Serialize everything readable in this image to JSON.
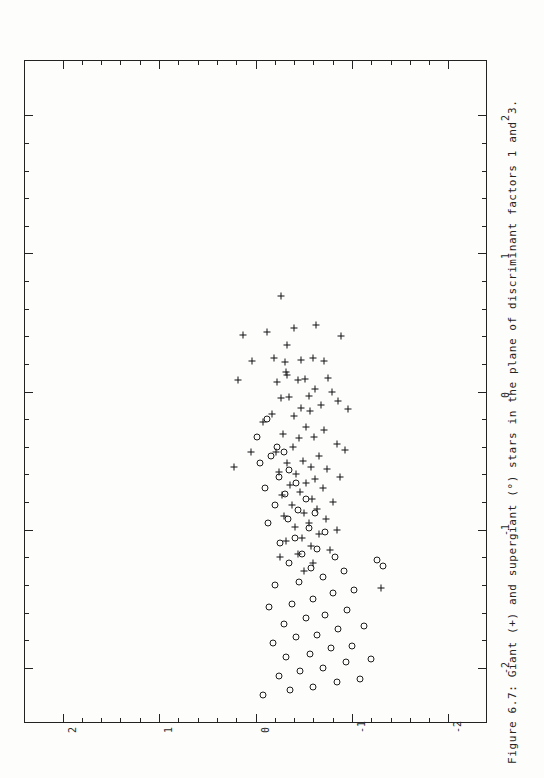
{
  "figure": {
    "caption": "Figure 6.7:  Giant  (+)  and supergiant  (°)  stars in the plane of discriminant factors 1 and 3.",
    "caption_label": "Figure 6.7:",
    "orientation": "rotated-90-ccw"
  },
  "chart_data": {
    "type": "scatter",
    "title": "Figure 6.7:  Giant  (+)  and supergiant  (°)  stars in the plane of discriminant factors 1 and 3.",
    "xlabel": "discriminant factor 1",
    "ylabel": "discriminant factor 3",
    "xlim": [
      -2.4,
      2.4
    ],
    "ylim": [
      -2.4,
      2.4
    ],
    "grid": false,
    "legend_position": "none",
    "x_ticks": [
      2,
      1,
      0,
      -1,
      -2
    ],
    "x_tick_labels": [
      "2",
      "1",
      "0",
      "-1",
      "-2"
    ],
    "y_ticks": [
      2,
      1,
      0,
      -1,
      -2
    ],
    "y_tick_labels": [
      "2",
      "1",
      "0",
      "-1",
      "-2"
    ],
    "minor_ticks_per_interval": 4,
    "series": [
      {
        "name": "Giant (+)",
        "marker": "plus",
        "count": 78,
        "points": [
          [
            -0.26,
            0.69
          ],
          [
            -0.63,
            0.48
          ],
          [
            -0.4,
            0.46
          ],
          [
            -0.12,
            0.43
          ],
          [
            -0.89,
            0.4
          ],
          [
            0.13,
            0.41
          ],
          [
            -0.33,
            0.34
          ],
          [
            -0.6,
            0.24
          ],
          [
            -0.47,
            0.23
          ],
          [
            -0.71,
            0.22
          ],
          [
            -0.19,
            0.24
          ],
          [
            -0.31,
            0.21
          ],
          [
            -0.32,
            0.14
          ],
          [
            -0.33,
            0.12
          ],
          [
            -0.75,
            0.1
          ],
          [
            -0.51,
            0.09
          ],
          [
            -0.44,
            0.08
          ],
          [
            -0.22,
            0.07
          ],
          [
            -0.62,
            0.02
          ],
          [
            -0.79,
            0.0
          ],
          [
            -0.55,
            -0.03
          ],
          [
            -0.35,
            -0.04
          ],
          [
            -0.26,
            -0.05
          ],
          [
            -0.86,
            -0.07
          ],
          [
            -0.68,
            -0.1
          ],
          [
            -0.47,
            -0.12
          ],
          [
            -0.96,
            -0.13
          ],
          [
            -0.57,
            -0.14
          ],
          [
            -0.4,
            -0.18
          ],
          [
            0.04,
            0.22
          ],
          [
            0.18,
            0.08
          ],
          [
            -0.17,
            -0.16
          ],
          [
            -0.08,
            -0.22
          ],
          [
            -0.52,
            -0.26
          ],
          [
            -0.71,
            -0.28
          ],
          [
            -0.61,
            -0.33
          ],
          [
            -0.45,
            -0.34
          ],
          [
            -0.28,
            -0.31
          ],
          [
            -0.39,
            -0.4
          ],
          [
            -0.84,
            -0.38
          ],
          [
            -0.93,
            -0.42
          ],
          [
            -0.21,
            -0.44
          ],
          [
            -0.66,
            -0.47
          ],
          [
            -0.49,
            -0.5
          ],
          [
            -0.33,
            -0.52
          ],
          [
            -0.58,
            -0.55
          ],
          [
            -0.74,
            -0.56
          ],
          [
            -0.24,
            -0.58
          ],
          [
            -0.42,
            -0.6
          ],
          [
            -0.62,
            -0.63
          ],
          [
            -0.88,
            -0.62
          ],
          [
            -0.52,
            -0.66
          ],
          [
            -0.36,
            -0.68
          ],
          [
            -0.7,
            -0.7
          ],
          [
            -0.46,
            -0.73
          ],
          [
            -0.27,
            -0.75
          ],
          [
            -0.59,
            -0.78
          ],
          [
            -0.8,
            -0.8
          ],
          [
            -0.38,
            -0.82
          ],
          [
            -0.64,
            -0.85
          ],
          [
            -0.5,
            -0.88
          ],
          [
            -0.3,
            -0.9
          ],
          [
            -0.73,
            -0.92
          ],
          [
            -0.55,
            -0.95
          ],
          [
            -0.41,
            -0.98
          ],
          [
            -0.85,
            -1.0
          ],
          [
            -0.66,
            -1.03
          ],
          [
            -0.48,
            -1.06
          ],
          [
            -0.32,
            -1.08
          ],
          [
            -0.58,
            -1.12
          ],
          [
            -0.77,
            -1.15
          ],
          [
            -0.44,
            -1.18
          ],
          [
            -0.25,
            -1.2
          ],
          [
            -0.6,
            -1.24
          ],
          [
            -0.5,
            -1.3
          ],
          [
            0.05,
            -0.44
          ],
          [
            0.22,
            -0.55
          ],
          [
            -1.3,
            -1.42
          ]
        ]
      },
      {
        "name": "Supergiant (°)",
        "marker": "circle",
        "count": 60,
        "points": [
          [
            -0.12,
            -0.2
          ],
          [
            -0.02,
            -0.33
          ],
          [
            -0.22,
            -0.4
          ],
          [
            -0.3,
            -0.44
          ],
          [
            -0.16,
            -0.47
          ],
          [
            -0.05,
            -0.52
          ],
          [
            -0.35,
            -0.57
          ],
          [
            -0.24,
            -0.62
          ],
          [
            -0.42,
            -0.66
          ],
          [
            -0.1,
            -0.7
          ],
          [
            -0.31,
            -0.74
          ],
          [
            -0.52,
            -0.78
          ],
          [
            -0.2,
            -0.82
          ],
          [
            -0.44,
            -0.86
          ],
          [
            -0.62,
            -0.88
          ],
          [
            -0.34,
            -0.92
          ],
          [
            -0.13,
            -0.95
          ],
          [
            -0.55,
            -0.99
          ],
          [
            -0.72,
            -1.02
          ],
          [
            -0.41,
            -1.06
          ],
          [
            -0.25,
            -1.1
          ],
          [
            -0.64,
            -1.14
          ],
          [
            -0.48,
            -1.18
          ],
          [
            -0.82,
            -1.2
          ],
          [
            -0.35,
            -1.24
          ],
          [
            -0.58,
            -1.28
          ],
          [
            -0.92,
            -1.3
          ],
          [
            -0.7,
            -1.34
          ],
          [
            -0.45,
            -1.38
          ],
          [
            -0.2,
            -1.4
          ],
          [
            -1.02,
            -1.44
          ],
          [
            -0.8,
            -1.46
          ],
          [
            -0.6,
            -1.5
          ],
          [
            -0.38,
            -1.54
          ],
          [
            -0.14,
            -1.56
          ],
          [
            -0.95,
            -1.58
          ],
          [
            -0.72,
            -1.62
          ],
          [
            -0.52,
            -1.64
          ],
          [
            -0.3,
            -1.68
          ],
          [
            -1.12,
            -1.7
          ],
          [
            -0.86,
            -1.72
          ],
          [
            -0.64,
            -1.76
          ],
          [
            -0.42,
            -1.78
          ],
          [
            -0.18,
            -1.82
          ],
          [
            -1.0,
            -1.84
          ],
          [
            -0.78,
            -1.86
          ],
          [
            -0.56,
            -1.9
          ],
          [
            -0.32,
            -1.92
          ],
          [
            -1.2,
            -1.94
          ],
          [
            -0.94,
            -1.96
          ],
          [
            -0.7,
            -2.0
          ],
          [
            -0.46,
            -2.02
          ],
          [
            -0.24,
            -2.06
          ],
          [
            -1.08,
            -2.08
          ],
          [
            -0.84,
            -2.1
          ],
          [
            -0.6,
            -2.14
          ],
          [
            -0.36,
            -2.16
          ],
          [
            -1.26,
            -1.22
          ],
          [
            -1.32,
            -1.26
          ],
          [
            -0.08,
            -2.2
          ]
        ]
      }
    ]
  }
}
